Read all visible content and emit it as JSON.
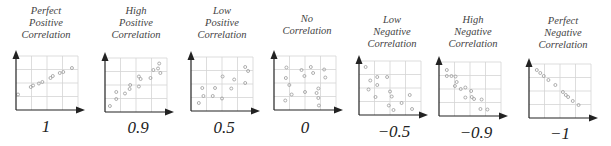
{
  "chart_data": [
    {
      "type": "scatter",
      "title": "Perfect Positive Correlation",
      "coefficient_label": "1",
      "r": 1,
      "points": [
        [
          0.0,
          0.27
        ],
        [
          0.22,
          0.42
        ],
        [
          0.26,
          0.45
        ],
        [
          0.36,
          0.49
        ],
        [
          0.42,
          0.52
        ],
        [
          0.56,
          0.6
        ],
        [
          0.6,
          0.64
        ],
        [
          0.72,
          0.7
        ],
        [
          0.78,
          0.72
        ],
        [
          0.93,
          0.8
        ]
      ]
    },
    {
      "type": "scatter",
      "title": "High Positive Correlation",
      "coefficient_label": "0.9",
      "r": 0.9,
      "points": [
        [
          0.05,
          0.08
        ],
        [
          0.16,
          0.22
        ],
        [
          0.16,
          0.36
        ],
        [
          0.31,
          0.33
        ],
        [
          0.39,
          0.42
        ],
        [
          0.4,
          0.5
        ],
        [
          0.55,
          0.67
        ],
        [
          0.55,
          0.47
        ],
        [
          0.58,
          0.62
        ],
        [
          0.75,
          0.64
        ],
        [
          0.8,
          0.8
        ],
        [
          0.88,
          0.83
        ],
        [
          0.9,
          0.93
        ],
        [
          0.92,
          0.74
        ]
      ]
    },
    {
      "type": "scatter",
      "title": "Low Positive Correlation",
      "coefficient_label": "0.5",
      "r": 0.5,
      "points": [
        [
          0.1,
          0.12
        ],
        [
          0.16,
          0.42
        ],
        [
          0.18,
          0.26
        ],
        [
          0.34,
          0.26
        ],
        [
          0.38,
          0.42
        ],
        [
          0.5,
          0.21
        ],
        [
          0.51,
          0.65
        ],
        [
          0.66,
          0.41
        ],
        [
          0.71,
          0.59
        ],
        [
          0.9,
          0.52
        ],
        [
          0.9,
          0.84
        ],
        [
          0.95,
          0.76
        ]
      ]
    },
    {
      "type": "scatter",
      "title": "No Correlation",
      "coefficient_label": "0",
      "r": 0,
      "points": [
        [
          0.16,
          0.15
        ],
        [
          0.18,
          0.81
        ],
        [
          0.17,
          0.6
        ],
        [
          0.23,
          0.46
        ],
        [
          0.27,
          0.27
        ],
        [
          0.44,
          0.76
        ],
        [
          0.49,
          0.64
        ],
        [
          0.5,
          0.32
        ],
        [
          0.6,
          0.82
        ],
        [
          0.64,
          0.7
        ],
        [
          0.7,
          0.3
        ],
        [
          0.73,
          0.39
        ],
        [
          0.73,
          0.2
        ],
        [
          0.74,
          0.05
        ],
        [
          0.83,
          0.77
        ],
        [
          0.85,
          0.61
        ]
      ]
    },
    {
      "type": "scatter",
      "title": "Low Negative Correlation",
      "coefficient_label": "−0.5",
      "r": -0.5,
      "points": [
        [
          0.08,
          0.92
        ],
        [
          0.16,
          0.65
        ],
        [
          0.28,
          0.72
        ],
        [
          0.28,
          0.56
        ],
        [
          0.13,
          0.47
        ],
        [
          0.25,
          0.32
        ],
        [
          0.45,
          0.72
        ],
        [
          0.5,
          0.43
        ],
        [
          0.48,
          0.15
        ],
        [
          0.53,
          0.33
        ],
        [
          0.56,
          0.06
        ],
        [
          0.7,
          0.2
        ],
        [
          0.84,
          0.36
        ],
        [
          0.88,
          0.08
        ]
      ]
    },
    {
      "type": "scatter",
      "title": "High Negative Correlation",
      "coefficient_label": "−0.9",
      "r": -0.9,
      "points": [
        [
          0.1,
          0.88
        ],
        [
          0.1,
          0.76
        ],
        [
          0.18,
          0.76
        ],
        [
          0.25,
          0.75
        ],
        [
          0.27,
          0.64
        ],
        [
          0.24,
          0.56
        ],
        [
          0.34,
          0.5
        ],
        [
          0.42,
          0.53
        ],
        [
          0.52,
          0.46
        ],
        [
          0.42,
          0.33
        ],
        [
          0.53,
          0.34
        ],
        [
          0.57,
          0.3
        ],
        [
          0.7,
          0.29
        ],
        [
          0.68,
          0.1
        ],
        [
          0.8,
          0.09
        ]
      ]
    },
    {
      "type": "scatter",
      "title": "Perfect Negative Correlation",
      "coefficient_label": "−1",
      "r": -1,
      "points": [
        [
          0.1,
          0.92
        ],
        [
          0.16,
          0.86
        ],
        [
          0.22,
          0.8
        ],
        [
          0.3,
          0.72
        ],
        [
          0.42,
          0.62
        ],
        [
          0.55,
          0.48
        ],
        [
          0.6,
          0.42
        ],
        [
          0.64,
          0.38
        ],
        [
          0.72,
          0.3
        ],
        [
          0.82,
          0.22
        ]
      ]
    }
  ],
  "panels": [
    {
      "title_lines": [
        "Perfect",
        "Positive",
        "Correlation"
      ],
      "value": "1"
    },
    {
      "title_lines": [
        "High",
        "Positive",
        "Correlation"
      ],
      "value": "0.9"
    },
    {
      "title_lines": [
        "Low",
        "Positive",
        "Correlation"
      ],
      "value": "0.5"
    },
    {
      "title_lines": [
        "",
        "No",
        "Correlation"
      ],
      "value": "0"
    },
    {
      "title_lines": [
        "Low",
        "Negative",
        "Correlation"
      ],
      "value": "−0.5"
    },
    {
      "title_lines": [
        "High",
        "Negative",
        "Correlation"
      ],
      "value": "−0.9"
    },
    {
      "title_lines": [
        "Perfect",
        "Negative",
        "Correlation"
      ],
      "value": "−1"
    }
  ],
  "colors": {
    "axis": "#222222",
    "grid": "#d4d4d4",
    "point": "#9a9a9a",
    "title": "#444444",
    "value": "#222222"
  }
}
